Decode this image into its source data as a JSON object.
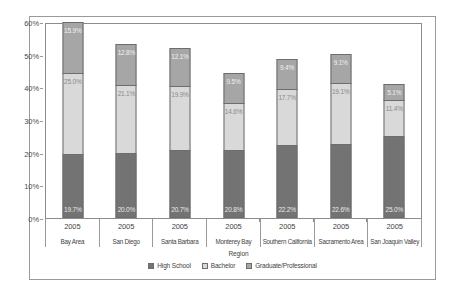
{
  "chart_data": {
    "type": "bar",
    "subtype": "stacked-column",
    "title": "",
    "xlabel": "Region",
    "ylabel": "",
    "ylim": [
      0,
      60
    ],
    "yunit": "%",
    "grid": false,
    "legend_position": "bottom",
    "ytick_labels": [
      "0%",
      "10%",
      "20%",
      "30%",
      "40%",
      "50%",
      "60%"
    ],
    "ytick_values": [
      0,
      10,
      20,
      30,
      40,
      50,
      60
    ],
    "categories": [
      "Bay Area",
      "San Diego",
      "Santa Barbara",
      "Monterey Bay",
      "Southern California",
      "Sacramento Area",
      "San Joaquin Valley"
    ],
    "category_years": [
      "2005",
      "2005",
      "2005",
      "2005",
      "2005",
      "2005",
      "2005"
    ],
    "series": [
      {
        "name": "High School",
        "color": "#737373",
        "values": [
          19.7,
          20.0,
          20.7,
          20.8,
          22.2,
          22.6,
          25.0
        ],
        "labels": [
          "19.7%",
          "20.0%",
          "20.7%",
          "20.8%",
          "22.2%",
          "22.6%",
          "25.0%"
        ]
      },
      {
        "name": "Bachelor",
        "color": "#d9d9d9",
        "values": [
          25.0,
          21.1,
          19.9,
          14.6,
          17.7,
          19.1,
          11.4
        ],
        "labels": [
          "25.0%",
          "21.1%",
          "19.9%",
          "14.6%",
          "17.7%",
          "19.1%",
          "11.4%"
        ]
      },
      {
        "name": "Graduate/Professional",
        "color": "#a6a6a6",
        "values": [
          15.9,
          12.8,
          12.1,
          9.5,
          9.4,
          9.1,
          5.1
        ],
        "labels": [
          "15.9%",
          "12.8%",
          "12.1%",
          "9.5%",
          "9.4%",
          "9.1%",
          "5.1%"
        ]
      }
    ],
    "totals": [
      60.6,
      53.9,
      52.7,
      44.9,
      49.3,
      50.8,
      41.5
    ]
  }
}
